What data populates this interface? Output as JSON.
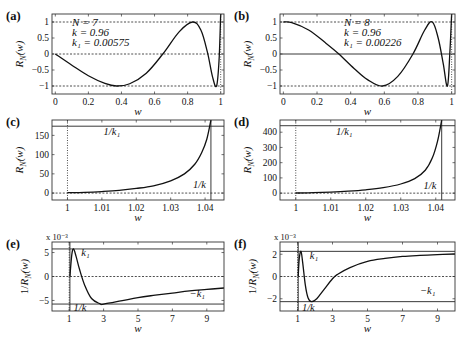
{
  "figure": {
    "panels": [
      "a",
      "b",
      "c",
      "d",
      "e",
      "f"
    ]
  },
  "chart_data": [
    {
      "id": "a",
      "panel_label": "(a)",
      "type": "line",
      "title": "",
      "xlabel": "w",
      "ylabel": "R_N(w)",
      "xlim": [
        -0.02,
        1.02
      ],
      "ylim": [
        -1.25,
        1.25
      ],
      "xticks": [
        0,
        0.2,
        0.4,
        0.6,
        0.8,
        1
      ],
      "xtick_labels": [
        "0",
        "0.2",
        "0.4",
        "0.6",
        "0.8",
        "1"
      ],
      "yticks": [
        -1,
        -0.5,
        0,
        0.5,
        1
      ],
      "ytick_labels": [
        "−1",
        "−0.5",
        "0",
        "0.5",
        "1"
      ],
      "params": {
        "N": 7,
        "k": 0.96,
        "k1": 0.00575
      },
      "param_text": [
        "N = 7",
        "k = 0.96",
        "k₁ = 0.00575"
      ],
      "reference_lines": {
        "dashed_h": [
          1,
          0,
          -1
        ],
        "dotted_v": [
          1
        ]
      },
      "series": [
        {
          "name": "R_7(w)",
          "x": [
            0,
            0.1,
            0.2,
            0.3,
            0.37,
            0.45,
            0.55,
            0.65,
            0.75,
            0.83,
            0.88,
            0.92,
            0.95,
            0.975,
            0.99,
            1.0
          ],
          "y": [
            0,
            -0.35,
            -0.68,
            -0.92,
            -1,
            -0.93,
            -0.6,
            0,
            0.7,
            1,
            0.75,
            0.05,
            -0.7,
            -1,
            -0.2,
            1.25
          ]
        }
      ],
      "grid": false
    },
    {
      "id": "b",
      "panel_label": "(b)",
      "type": "line",
      "xlabel": "w",
      "ylabel": "R_N(w)",
      "xlim": [
        -0.02,
        1.02
      ],
      "ylim": [
        -1.25,
        1.25
      ],
      "xticks": [
        0,
        0.2,
        0.4,
        0.6,
        0.8,
        1
      ],
      "xtick_labels": [
        "0",
        "0.2",
        "0.4",
        "0.6",
        "0.8",
        "1"
      ],
      "yticks": [
        -1,
        -0.5,
        0,
        0.5,
        1
      ],
      "ytick_labels": [
        "−1",
        "−0.5",
        "0",
        "0.5",
        "1"
      ],
      "params": {
        "N": 8,
        "k": 0.96,
        "k1": 0.00226
      },
      "param_text": [
        "N = 8",
        "k = 0.96",
        "k₁ = 0.00226"
      ],
      "reference_lines": {
        "dashed_h": [
          1,
          -1
        ],
        "solid_h": [
          0
        ],
        "dotted_v": [
          1
        ]
      },
      "series": [
        {
          "name": "R_8(w)",
          "x": [
            0,
            0.05,
            0.15,
            0.25,
            0.33,
            0.42,
            0.5,
            0.59,
            0.68,
            0.77,
            0.84,
            0.885,
            0.92,
            0.95,
            0.975,
            0.99,
            1.0
          ],
          "y": [
            1,
            0.98,
            0.75,
            0.35,
            0,
            -0.45,
            -0.8,
            -1,
            -0.7,
            0,
            0.75,
            1,
            0.5,
            -0.3,
            -1,
            0.1,
            1.25
          ]
        }
      ],
      "grid": false
    },
    {
      "id": "c",
      "panel_label": "(c)",
      "type": "line",
      "xlabel": "w",
      "ylabel": "R_N(w)",
      "xlim": [
        0.9955,
        1.0455
      ],
      "ylim": [
        -18,
        190
      ],
      "xticks": [
        1,
        1.01,
        1.02,
        1.03,
        1.04
      ],
      "xtick_labels": [
        "1",
        "1.01",
        "1.02",
        "1.03",
        "1.04"
      ],
      "yticks": [
        0,
        50,
        100,
        150
      ],
      "ytick_labels": [
        "0",
        "50",
        "100",
        "150"
      ],
      "reference_lines": {
        "solid_h": [
          173.9
        ],
        "dashed_h": [
          0
        ],
        "dotted_v": [
          1
        ],
        "solid_v": [
          1.0417
        ]
      },
      "annotations": [
        {
          "text": "1/k₁",
          "x": 1.0105,
          "y": 150
        },
        {
          "text": "1/k",
          "x": 1.0365,
          "y": 12
        }
      ],
      "series": [
        {
          "name": "R_7(w), w>1",
          "x": [
            1,
            1.005,
            1.01,
            1.015,
            1.02,
            1.025,
            1.03,
            1.034,
            1.037,
            1.039,
            1.0405,
            1.0417
          ],
          "y": [
            1,
            2,
            4,
            7,
            12,
            19,
            32,
            50,
            75,
            105,
            140,
            190
          ]
        }
      ],
      "grid": false
    },
    {
      "id": "d",
      "panel_label": "(d)",
      "type": "line",
      "xlabel": "w",
      "ylabel": "R_N(w)",
      "xlim": [
        0.9955,
        1.0455
      ],
      "ylim": [
        -45,
        480
      ],
      "xticks": [
        1,
        1.01,
        1.02,
        1.03,
        1.04
      ],
      "xtick_labels": [
        "1",
        "1.01",
        "1.02",
        "1.03",
        "1.04"
      ],
      "yticks": [
        0,
        100,
        200,
        300,
        400
      ],
      "ytick_labels": [
        "0",
        "100",
        "200",
        "300",
        "400"
      ],
      "reference_lines": {
        "solid_h": [
          442.5
        ],
        "dashed_h": [
          0
        ],
        "dotted_v": [
          1
        ],
        "solid_v": [
          1.0417
        ]
      },
      "annotations": [
        {
          "text": "1/k₁",
          "x": 1.0115,
          "y": 380
        },
        {
          "text": "1/k",
          "x": 1.0365,
          "y": 30
        }
      ],
      "series": [
        {
          "name": "R_8(w), w>1",
          "x": [
            1,
            1.005,
            1.01,
            1.015,
            1.02,
            1.025,
            1.03,
            1.034,
            1.037,
            1.039,
            1.0405,
            1.0417
          ],
          "y": [
            1,
            3,
            7,
            13,
            22,
            36,
            60,
            95,
            150,
            230,
            340,
            480
          ]
        }
      ],
      "grid": false
    },
    {
      "id": "e",
      "panel_label": "(e)",
      "type": "line",
      "xlabel": "w",
      "ylabel": "1/R_N(w)",
      "y_scale_note": "x 10⁻³",
      "xlim": [
        0,
        10
      ],
      "ylim": [
        -7.2,
        7.2
      ],
      "xticks": [
        1,
        3,
        5,
        7,
        9
      ],
      "xtick_labels": [
        "1",
        "3",
        "5",
        "7",
        "9"
      ],
      "yticks": [
        -5,
        0,
        5
      ],
      "ytick_labels": [
        "−5",
        "0",
        "5"
      ],
      "reference_lines": {
        "solid_h": [
          5.75,
          -5.75
        ],
        "dashed_h": [
          0
        ],
        "dotted_v": [
          1
        ],
        "solid_v": [
          1.0417
        ]
      },
      "annotations": [
        {
          "text": "k₁",
          "x": 1.7,
          "y": 4.3
        },
        {
          "text": "−k₁",
          "x": 8.0,
          "y": -4.3
        },
        {
          "text": "1/k",
          "x": 1.25,
          "y": -7.2
        }
      ],
      "series": [
        {
          "name": "1/R_7(w) (×10⁻³)",
          "x": [
            1.0417,
            1.15,
            1.25,
            1.4,
            1.6,
            1.9,
            2.3,
            2.8,
            3.0,
            4,
            5,
            6,
            7,
            8,
            9,
            10
          ],
          "y": [
            0,
            4.5,
            5.75,
            4.2,
            1.5,
            -1.8,
            -4.6,
            -5.7,
            -5.75,
            -5.1,
            -4.4,
            -3.9,
            -3.45,
            -3.0,
            -2.7,
            -2.4
          ]
        }
      ],
      "grid": false
    },
    {
      "id": "f",
      "panel_label": "(f)",
      "type": "line",
      "xlabel": "w",
      "ylabel": "1/R_N(w)",
      "y_scale_note": "x 10⁻³",
      "xlim": [
        0,
        10
      ],
      "ylim": [
        -3.1,
        3.1
      ],
      "xticks": [
        1,
        3,
        5,
        7,
        9
      ],
      "xtick_labels": [
        "1",
        "3",
        "5",
        "7",
        "9"
      ],
      "yticks": [
        -2,
        0,
        2
      ],
      "ytick_labels": [
        "−2",
        "0",
        "2"
      ],
      "reference_lines": {
        "solid_h": [
          2.26,
          -2.26
        ],
        "dashed_h": [
          0
        ],
        "dotted_v": [
          1
        ],
        "solid_v": [
          1.0417
        ]
      },
      "annotations": [
        {
          "text": "k₁",
          "x": 1.7,
          "y": 1.55
        },
        {
          "text": "−k₁",
          "x": 8.0,
          "y": -1.55
        },
        {
          "text": "1/k",
          "x": 1.25,
          "y": -3.1
        }
      ],
      "series": [
        {
          "name": "1/R_8(w) (×10⁻³)",
          "x": [
            1.0417,
            1.1,
            1.2,
            1.3,
            1.45,
            1.6,
            1.8,
            2.1,
            2.5,
            3.0,
            3.3,
            4,
            5,
            6,
            7,
            8,
            9,
            10
          ],
          "y": [
            0,
            1.6,
            2.26,
            1.2,
            -0.8,
            -1.9,
            -2.26,
            -2.0,
            -1.2,
            -0.2,
            0.2,
            0.8,
            1.35,
            1.62,
            1.8,
            1.9,
            1.97,
            2.02
          ]
        }
      ],
      "grid": false
    }
  ],
  "layout_frames": {
    "a": {
      "x": 52,
      "y": 14,
      "w": 172,
      "h": 80
    },
    "b": {
      "x": 280,
      "y": 14,
      "w": 175,
      "h": 80
    },
    "c": {
      "x": 52,
      "y": 120,
      "w": 172,
      "h": 80
    },
    "d": {
      "x": 280,
      "y": 120,
      "w": 175,
      "h": 80
    },
    "e": {
      "x": 52,
      "y": 242,
      "w": 172,
      "h": 69
    },
    "f": {
      "x": 280,
      "y": 242,
      "w": 175,
      "h": 69
    }
  }
}
